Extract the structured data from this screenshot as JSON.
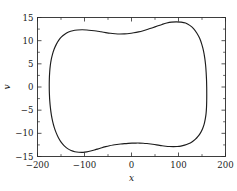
{
  "chart_data": {
    "type": "line",
    "title": "",
    "subtitle": "",
    "xlabel": "x",
    "ylabel": "v",
    "xlim": [
      -200,
      200
    ],
    "ylim": [
      -15,
      15
    ],
    "grid": false,
    "legend": null,
    "xticks": [
      -200,
      -100,
      0,
      100,
      200
    ],
    "xticklabels": [
      "−200",
      "−100",
      "0",
      "100",
      "200"
    ],
    "yticks": [
      -15,
      -10,
      -5,
      0,
      5,
      10,
      15
    ],
    "yticklabels": [
      "−15",
      "−10",
      "−5",
      "0",
      "5",
      "10",
      "15"
    ],
    "x_minor_tick_interval": 50,
    "y_minor_tick_interval": 2.5,
    "series": [
      {
        "name": "closed orbit",
        "closed": true,
        "color": "#1c1c1c",
        "points": [
          [
            160.0,
            0.0
          ],
          [
            159.6,
            1.6
          ],
          [
            158.8,
            3.2
          ],
          [
            157.6,
            4.8
          ],
          [
            155.8,
            6.3
          ],
          [
            153.2,
            7.8
          ],
          [
            149.6,
            9.2
          ],
          [
            145.0,
            10.5
          ],
          [
            139.2,
            11.6
          ],
          [
            132.0,
            12.6
          ],
          [
            124.0,
            13.3
          ],
          [
            115.0,
            13.8
          ],
          [
            105.0,
            14.0
          ],
          [
            95.0,
            14.05
          ],
          [
            85.0,
            14.0
          ],
          [
            75.0,
            13.8
          ],
          [
            65.0,
            13.5
          ],
          [
            55.0,
            13.15
          ],
          [
            45.0,
            12.8
          ],
          [
            35.0,
            12.45
          ],
          [
            25.0,
            12.15
          ],
          [
            15.0,
            11.9
          ],
          [
            5.0,
            11.7
          ],
          [
            -5.0,
            11.55
          ],
          [
            -15.0,
            11.48
          ],
          [
            -25.0,
            11.45
          ],
          [
            -35.0,
            11.5
          ],
          [
            -45.0,
            11.6
          ],
          [
            -55.0,
            11.75
          ],
          [
            -65.0,
            11.92
          ],
          [
            -75.0,
            12.08
          ],
          [
            -85.0,
            12.2
          ],
          [
            -95.0,
            12.3
          ],
          [
            -105.0,
            12.35
          ],
          [
            -115.0,
            12.3
          ],
          [
            -125.0,
            12.15
          ],
          [
            -134.0,
            11.85
          ],
          [
            -142.0,
            11.4
          ],
          [
            -149.0,
            10.8
          ],
          [
            -155.0,
            10.05
          ],
          [
            -160.0,
            9.2
          ],
          [
            -164.5,
            8.2
          ],
          [
            -168.0,
            7.1
          ],
          [
            -170.8,
            5.9
          ],
          [
            -172.8,
            4.6
          ],
          [
            -174.1,
            3.2
          ],
          [
            -174.8,
            1.7
          ],
          [
            -175.0,
            0.2
          ],
          [
            -174.7,
            -1.4
          ],
          [
            -173.9,
            -3.0
          ],
          [
            -172.5,
            -4.5
          ],
          [
            -170.5,
            -6.0
          ],
          [
            -167.8,
            -7.4
          ],
          [
            -164.4,
            -8.7
          ],
          [
            -160.2,
            -9.9
          ],
          [
            -155.2,
            -11.0
          ],
          [
            -149.4,
            -11.95
          ],
          [
            -143.0,
            -12.7
          ],
          [
            -136.0,
            -13.3
          ],
          [
            -128.5,
            -13.72
          ],
          [
            -120.5,
            -13.97
          ],
          [
            -112.0,
            -14.08
          ],
          [
            -103.0,
            -14.1
          ],
          [
            -95.0,
            -14.0
          ],
          [
            -87.0,
            -13.82
          ],
          [
            -79.0,
            -13.6
          ],
          [
            -71.0,
            -13.35
          ],
          [
            -63.0,
            -13.1
          ],
          [
            -55.0,
            -12.88
          ],
          [
            -47.0,
            -12.68
          ],
          [
            -39.0,
            -12.52
          ],
          [
            -31.0,
            -12.4
          ],
          [
            -23.0,
            -12.3
          ],
          [
            -15.0,
            -12.22
          ],
          [
            -7.0,
            -12.16
          ],
          [
            1.0,
            -12.12
          ],
          [
            9.0,
            -12.1
          ],
          [
            17.0,
            -12.1
          ],
          [
            25.0,
            -12.13
          ],
          [
            33.0,
            -12.2
          ],
          [
            41.0,
            -12.3
          ],
          [
            49.0,
            -12.42
          ],
          [
            57.0,
            -12.55
          ],
          [
            65.0,
            -12.68
          ],
          [
            73.0,
            -12.78
          ],
          [
            81.0,
            -12.85
          ],
          [
            89.0,
            -12.88
          ],
          [
            97.0,
            -12.85
          ],
          [
            105.0,
            -12.75
          ],
          [
            113.0,
            -12.55
          ],
          [
            121.0,
            -12.25
          ],
          [
            128.5,
            -11.85
          ],
          [
            135.5,
            -11.3
          ],
          [
            141.5,
            -10.65
          ],
          [
            146.8,
            -9.9
          ],
          [
            151.2,
            -9.0
          ],
          [
            154.6,
            -8.0
          ],
          [
            157.0,
            -6.9
          ],
          [
            158.7,
            -5.7
          ],
          [
            159.6,
            -4.4
          ],
          [
            160.0,
            -3.0
          ],
          [
            160.1,
            -1.5
          ],
          [
            160.0,
            0.0
          ]
        ]
      }
    ]
  },
  "axes": {
    "x_axis_name": "x-axis",
    "y_axis_name": "v-axis"
  }
}
